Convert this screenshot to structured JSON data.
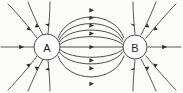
{
  "diagram": {
    "background_color": "#fbfbfa",
    "line_color": "#3a3a3a",
    "label_color": "#1d1d1d",
    "width": 183,
    "height": 93,
    "charges": [
      {
        "id": "A",
        "label": "A",
        "cx": 47,
        "cy": 47,
        "r": 13,
        "polarity": "sink"
      },
      {
        "id": "B",
        "label": "B",
        "cx": 135,
        "cy": 47,
        "r": 12,
        "polarity": "sink"
      }
    ],
    "interior_lines": {
      "count": 7,
      "description": "Curved lines connecting charge A to charge B",
      "arrow_direction": "left"
    },
    "exterior_lines": {
      "count": 10,
      "description": "Radial lines entering each charge from outside",
      "arrow_direction": "inward"
    },
    "axis_lines": {
      "left_label": "horizontal field line entering A from the left",
      "right_label": "horizontal field line leaving B to the right"
    }
  }
}
